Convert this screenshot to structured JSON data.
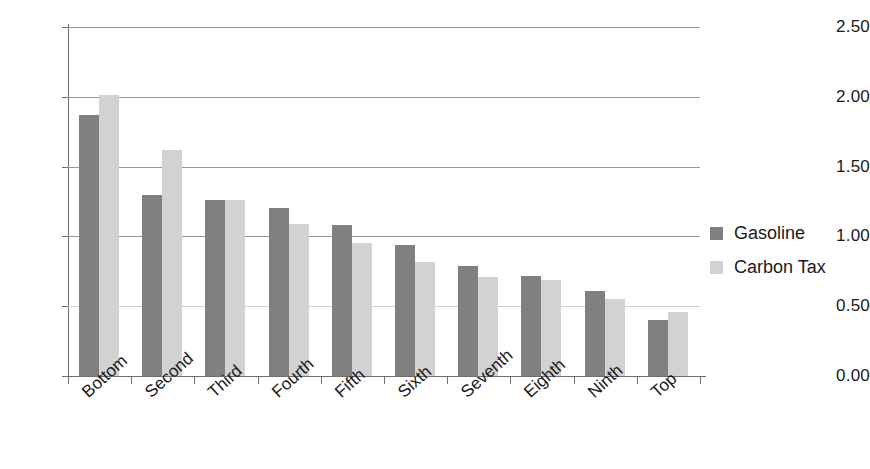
{
  "chart_data": {
    "type": "bar",
    "title": "",
    "subtitle": "",
    "xlabel": "",
    "ylabel": "",
    "ylim": [
      0,
      2.5
    ],
    "ytick_labels": [
      "0.00",
      "0.50",
      "1.00",
      "1.50",
      "2.00",
      "2.50"
    ],
    "ytick_values": [
      0,
      0.5,
      1.0,
      1.5,
      2.0,
      2.5
    ],
    "grid": true,
    "grid_axis": "y",
    "legend_position": "right",
    "orientation": "vertical",
    "grouping": "grouped",
    "categories": [
      "Bottom",
      "Second",
      "Third",
      "Fourth",
      "Fifth",
      "Sixth",
      "Seventh",
      "Eighth",
      "Ninth",
      "Top"
    ],
    "series": [
      {
        "name": "Gasoline",
        "color": "#808080",
        "values": [
          1.87,
          1.3,
          1.26,
          1.2,
          1.08,
          0.94,
          0.79,
          0.72,
          0.61,
          0.4
        ]
      },
      {
        "name": "Carbon Tax",
        "color": "#d2d2d2",
        "values": [
          2.01,
          1.62,
          1.26,
          1.09,
          0.95,
          0.82,
          0.71,
          0.69,
          0.55,
          0.46
        ]
      }
    ]
  },
  "legend": {
    "items": [
      {
        "label": "Gasoline",
        "color": "#808080"
      },
      {
        "label": "Carbon Tax",
        "color": "#d2d2d2"
      }
    ]
  },
  "axes": {
    "y": {
      "ticks": [
        "0.00",
        "0.50",
        "1.00",
        "1.50",
        "2.00",
        "2.50"
      ]
    },
    "x": {
      "ticks": [
        "Bottom",
        "Second",
        "Third",
        "Fourth",
        "Fifth",
        "Sixth",
        "Seventh",
        "Eighth",
        "Ninth",
        "Top"
      ]
    }
  }
}
